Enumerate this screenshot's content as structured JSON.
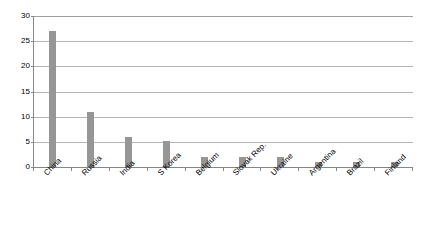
{
  "chart_data": {
    "type": "bar",
    "title": "",
    "subtitle": "",
    "xlabel": "",
    "ylabel": "",
    "categories": [
      "China",
      "Russia",
      "India",
      "S Korea",
      "Belgium",
      "Slovak Rep.",
      "Ukraine",
      "Argentina",
      "Brazil",
      "Finland"
    ],
    "values": [
      27,
      11,
      6,
      5.2,
      2,
      2,
      2,
      1,
      1,
      1
    ],
    "series": [
      {
        "name": "",
        "values": [
          27,
          11,
          6,
          5.2,
          2,
          2,
          2,
          1,
          1,
          1
        ]
      }
    ],
    "ylim": [
      0,
      30
    ],
    "ytick_step": 5,
    "ytick_labels": [
      "0",
      "5",
      "10",
      "15",
      "20",
      "25",
      "30"
    ],
    "ytick_values": [
      0,
      5,
      10,
      15,
      20,
      25,
      30
    ],
    "grid": true,
    "grid_axis": "y",
    "legend": false,
    "legend_position": "none",
    "annotations": [],
    "bar_color": "#969696",
    "gridline_color": "#b4b4b4",
    "axis_color": "#868686",
    "background_color": "#ffffff",
    "xtick_label_rotation": -45
  }
}
